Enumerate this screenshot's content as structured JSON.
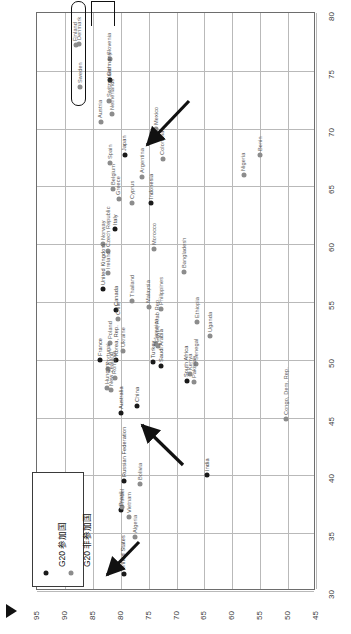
{
  "chart_data": {
    "type": "scatter",
    "title": "",
    "orientation": "rotated-90-ccw",
    "xlabel": "",
    "ylabel": "",
    "axis_bottom": {
      "name": "bottom-axis",
      "ticks": [
        95,
        90,
        85,
        80,
        75,
        70,
        65,
        60,
        55,
        50,
        45
      ],
      "range": [
        95,
        45
      ],
      "direction": "decreasing-left-to-right"
    },
    "axis_right": {
      "name": "right-axis",
      "ticks": [
        80,
        75,
        70,
        65,
        60,
        55,
        50,
        45,
        40,
        35,
        30
      ],
      "range": [
        80,
        30
      ],
      "direction": "decreasing-top-to-bottom"
    },
    "grid": true,
    "legend": {
      "position": "bottom-left",
      "entries": [
        {
          "label": "G20 参加国",
          "marker": "black-dot",
          "color": "#1a1a1a"
        },
        {
          "label": "G20 非参加国",
          "marker": "gray-dot",
          "color": "#8c8c8c"
        }
      ]
    },
    "series": [
      {
        "name": "G20 参加国",
        "color": "#1a1a1a",
        "points": [
          {
            "label": "Germany",
            "x": 82.0,
            "y": 74.2
          },
          {
            "label": "Japan",
            "x": 79.3,
            "y": 67.7
          },
          {
            "label": "Italy",
            "x": 81.0,
            "y": 61.3
          },
          {
            "label": "United Kingdom",
            "x": 83.2,
            "y": 56.1
          },
          {
            "label": "Canada",
            "x": 80.9,
            "y": 54.3
          },
          {
            "label": "France",
            "x": 83.7,
            "y": 50.0
          },
          {
            "label": "Korea, Rep.",
            "x": 80.9,
            "y": 50.0
          },
          {
            "label": "Australia",
            "x": 80.0,
            "y": 45.4
          },
          {
            "label": "China",
            "x": 77.0,
            "y": 46.0
          },
          {
            "label": "Turkey",
            "x": 74.2,
            "y": 49.8
          },
          {
            "label": "Saudi Arabia",
            "x": 72.7,
            "y": 49.5
          },
          {
            "label": "South Africa",
            "x": 68.2,
            "y": 48.2
          },
          {
            "label": "Russian Federation",
            "x": 79.4,
            "y": 39.5
          },
          {
            "label": "Brazil",
            "x": 79.9,
            "y": 37.0
          },
          {
            "label": "India",
            "x": 64.5,
            "y": 40.0
          },
          {
            "label": "United States",
            "x": 79.5,
            "y": 31.5
          },
          {
            "label": "Indonesia",
            "x": 74.5,
            "y": 63.6
          }
        ]
      },
      {
        "name": "G20 非参加国",
        "color": "#8c8c8c",
        "points": [
          {
            "label": "Finland",
            "x": 88.1,
            "y": 77.2
          },
          {
            "label": "Denmark",
            "x": 87.4,
            "y": 77.3
          },
          {
            "label": "Sweden",
            "x": 87.3,
            "y": 73.6
          },
          {
            "label": "Slovenia",
            "x": 82.0,
            "y": 76.0
          },
          {
            "label": "Switzerland",
            "x": 82.1,
            "y": 72.4
          },
          {
            "label": "Netherlands",
            "x": 81.6,
            "y": 71.3
          },
          {
            "label": "Austria",
            "x": 83.6,
            "y": 70.6
          },
          {
            "label": "Spain",
            "x": 81.9,
            "y": 67.0
          },
          {
            "label": "Belgium",
            "x": 81.4,
            "y": 64.8
          },
          {
            "label": "Greece",
            "x": 80.4,
            "y": 63.9
          },
          {
            "label": "Cyprus",
            "x": 78.0,
            "y": 63.6
          },
          {
            "label": "Mexico",
            "x": 73.6,
            "y": 70.0
          },
          {
            "label": "Argentina",
            "x": 76.2,
            "y": 65.8
          },
          {
            "label": "Colombia",
            "x": 72.5,
            "y": 67.4
          },
          {
            "label": "Nigeria",
            "x": 58.0,
            "y": 66.0
          },
          {
            "label": "Benin",
            "x": 55.0,
            "y": 67.7
          },
          {
            "label": "Norway",
            "x": 83.2,
            "y": 60.0
          },
          {
            "label": "Czech Republic",
            "x": 82.2,
            "y": 59.4
          },
          {
            "label": "Morocco",
            "x": 74.0,
            "y": 59.6
          },
          {
            "label": "Bangladesh",
            "x": 68.7,
            "y": 57.6
          },
          {
            "label": "Ireland",
            "x": 82.2,
            "y": 57.5
          },
          {
            "label": "Thailand",
            "x": 77.9,
            "y": 55.1
          },
          {
            "label": "Malaysia",
            "x": 75.0,
            "y": 54.6
          },
          {
            "label": "Philippines",
            "x": 72.8,
            "y": 54.4
          },
          {
            "label": "Ethiopia",
            "x": 66.3,
            "y": 53.3
          },
          {
            "label": "Uganda",
            "x": 64.0,
            "y": 52.1
          },
          {
            "label": "Chile",
            "x": 80.5,
            "y": 53.5
          },
          {
            "label": "Poland",
            "x": 81.9,
            "y": 51.5
          },
          {
            "label": "Jamaica",
            "x": 73.7,
            "y": 51.4
          },
          {
            "label": "Ukraine",
            "x": 79.6,
            "y": 50.8
          },
          {
            "label": "Egypt, Arab Rep.",
            "x": 73.4,
            "y": 51.2
          },
          {
            "label": "Portugal",
            "x": 82.3,
            "y": 49.2
          },
          {
            "label": "Senegal",
            "x": 66.5,
            "y": 49.6
          },
          {
            "label": "Romania",
            "x": 81.1,
            "y": 48.4
          },
          {
            "label": "Kenya",
            "x": 67.6,
            "y": 48.8
          },
          {
            "label": "Pakistan",
            "x": 66.8,
            "y": 48.1
          },
          {
            "label": "Hungary",
            "x": 82.5,
            "y": 47.6
          },
          {
            "label": "New Zealand",
            "x": 81.8,
            "y": 47.4
          },
          {
            "label": "Congo, Dem. Rep.",
            "x": 50.3,
            "y": 44.9
          },
          {
            "label": "Bolivia",
            "x": 76.5,
            "y": 39.3
          },
          {
            "label": "Israel",
            "x": 79.8,
            "y": 37.3
          },
          {
            "label": "Vietnam",
            "x": 78.5,
            "y": 36.4
          },
          {
            "label": "Algeria",
            "x": 77.4,
            "y": 34.7
          }
        ]
      }
    ],
    "annotations": [
      {
        "name": "highlight-box",
        "type": "rounded-rect",
        "targets": [
          "Sweden",
          "Finland",
          "Denmark"
        ]
      },
      {
        "name": "highlight-bracket",
        "type": "bracket",
        "targets": [
          "Germany",
          "Slovenia",
          "Switzerland"
        ]
      },
      {
        "name": "arrow-japan",
        "type": "arrow",
        "points_to": "Japan"
      },
      {
        "name": "arrow-china",
        "type": "arrow",
        "points_to": "China"
      },
      {
        "name": "arrow-united-states",
        "type": "arrow",
        "points_to": "United States"
      },
      {
        "name": "corner-marker",
        "type": "triangle"
      }
    ]
  }
}
